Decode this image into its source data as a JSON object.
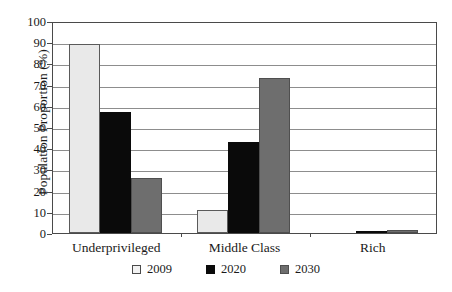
{
  "chart_data": {
    "type": "bar",
    "title": "",
    "xlabel": "",
    "ylabel": "Population Proportion (%)",
    "categories": [
      "Underprivileged",
      "Middle Class",
      "Rich"
    ],
    "series": [
      {
        "name": "2009",
        "values": [
          89,
          11,
          0
        ],
        "color": "#e9e9e9"
      },
      {
        "name": "2020",
        "values": [
          57,
          43,
          0.5
        ],
        "color": "#0a0a0a"
      },
      {
        "name": "2030",
        "values": [
          26,
          73,
          1.5
        ],
        "color": "#6e6e6e"
      }
    ],
    "ylim": [
      0,
      100
    ],
    "ytick_values": [
      0,
      10,
      20,
      30,
      40,
      50,
      60,
      70,
      80,
      90,
      100
    ],
    "ytick_labels": [
      "0",
      "10",
      "20",
      "30",
      "40",
      "50",
      "60",
      "70",
      "80",
      "90",
      "100"
    ],
    "grid": true,
    "grid_axis": "y",
    "legend_position": "bottom",
    "legend_entries": [
      "2009",
      "2020",
      "2030"
    ]
  }
}
